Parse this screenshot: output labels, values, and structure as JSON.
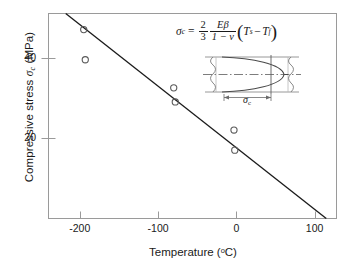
{
  "chart_data": {
    "type": "scatter",
    "title": "",
    "xlabel": "Temperature (oC)",
    "ylabel": "Compressive stress σc (MPa)",
    "xlim": [
      -240,
      128
    ],
    "ylim": [
      0,
      51
    ],
    "xticks": [
      -200,
      -100,
      0,
      100
    ],
    "yticks": [
      20,
      40
    ],
    "grid": false,
    "legend": "none",
    "series": [
      {
        "name": "Measured compressive stress",
        "marker": "open-circle",
        "points": [
          {
            "x": -195,
            "y": 47.0
          },
          {
            "x": -193,
            "y": 39.5
          },
          {
            "x": -80,
            "y": 32.5
          },
          {
            "x": -78,
            "y": 29.0
          },
          {
            "x": -3,
            "y": 22.0
          },
          {
            "x": -2,
            "y": 17.0
          }
        ]
      },
      {
        "name": "Linear fit",
        "type": "line",
        "endpoints": [
          {
            "x": -218,
            "y": 51.0
          },
          {
            "x": 128,
            "y": -2.0
          }
        ],
        "x_intercept": 115
      }
    ]
  },
  "axes": {
    "x_tick_labels": [
      "-200",
      "-100",
      "0",
      "100"
    ],
    "y_tick_labels": [
      "40",
      "20"
    ],
    "x_title_main": "Temperature (",
    "x_title_deg": "o",
    "x_title_unit": "C)",
    "y_title_pre": "Compressive stress ",
    "y_title_sym": "σ",
    "y_title_sub": "c",
    "y_title_post": " (MPa)"
  },
  "equation": {
    "lhs_symbol": "σ",
    "lhs_sub": "c",
    "equals": "=",
    "frac1_num": "2",
    "frac1_den": "3",
    "frac2_num": "Eβ",
    "frac2_den": "1 − ν",
    "paren_open": "(",
    "term1": "T",
    "term1_sub": "s",
    "minus": "−",
    "term2": "T",
    "term2_sub": "f",
    "paren_close": ")"
  },
  "inset": {
    "caption_symbol": "σ",
    "caption_sub": "c",
    "description": "parabolic compressive stress profile across plate thickness with centerline"
  },
  "colors": {
    "axis": "#9a9a9a",
    "line": "#1a1a1a",
    "marker": "#4d4d4d",
    "inset_line": "#6e6e6e",
    "background": "#ffffff"
  }
}
